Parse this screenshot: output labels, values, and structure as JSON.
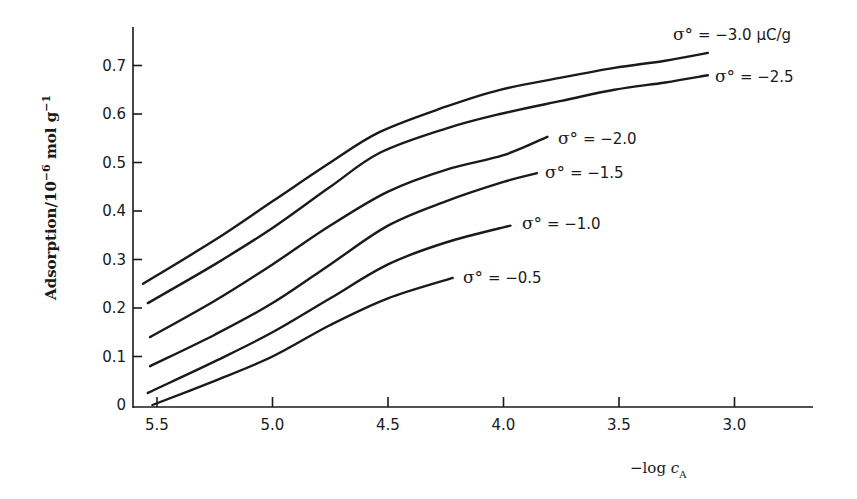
{
  "chart_data": {
    "type": "line",
    "title": "",
    "xlabel": "-log c_A",
    "xlabel_main": "−log ",
    "xlabel_var": "c",
    "xlabel_sub": "A",
    "ylabel": "Adsorption/10^-6 mol g^-1",
    "ylabel_main": "Adsorption/10",
    "ylabel_exp1": "−6",
    "ylabel_mid": " mol g",
    "ylabel_exp2": "−1",
    "xlim": [
      5.56,
      3.0
    ],
    "x_inverted": true,
    "ylim": [
      0,
      0.78
    ],
    "x_ticks": [
      5.5,
      5.0,
      4.5,
      4.0,
      3.5,
      3.0
    ],
    "x_tick_labels": [
      "5.5",
      "5.0",
      "4.5",
      "4.0",
      "3.5",
      "3.0"
    ],
    "y_ticks": [
      0,
      0.1,
      0.2,
      0.3,
      0.4,
      0.5,
      0.6,
      0.7
    ],
    "y_tick_labels": [
      "0",
      "0.1",
      "0.2",
      "0.3",
      "0.4",
      "0.5",
      "0.6",
      "0.7"
    ],
    "grid": false,
    "legend": "inline labels at curve ends",
    "series": [
      {
        "name": "σ° = −3.0 μC/g",
        "sigma": -3.0,
        "label_prefix": "σ°",
        "label_text": " = −3.0 μC/g",
        "x": [
          5.56,
          5.25,
          5.0,
          4.75,
          4.535,
          4.25,
          4.015,
          3.75,
          3.52,
          3.3,
          3.115
        ],
        "y": [
          0.25,
          0.34,
          0.42,
          0.5,
          0.563,
          0.615,
          0.65,
          0.675,
          0.695,
          0.71,
          0.726
        ]
      },
      {
        "name": "σ° = −2.5",
        "sigma": -2.5,
        "label_prefix": "σ°",
        "label_text": " = −2.5",
        "x": [
          5.54,
          5.25,
          5.0,
          4.75,
          4.535,
          4.25,
          4.015,
          3.75,
          3.52,
          3.3,
          3.115
        ],
        "y": [
          0.21,
          0.29,
          0.365,
          0.45,
          0.52,
          0.57,
          0.6,
          0.627,
          0.65,
          0.665,
          0.68
        ]
      },
      {
        "name": "σ° = −2.0",
        "sigma": -2.0,
        "label_prefix": "σ°",
        "label_text": " = −2.0",
        "x": [
          5.53,
          5.25,
          5.0,
          4.75,
          4.5,
          4.25,
          4.0,
          3.81
        ],
        "y": [
          0.14,
          0.215,
          0.29,
          0.37,
          0.44,
          0.485,
          0.515,
          0.553
        ]
      },
      {
        "name": "σ° = −1.5",
        "sigma": -1.5,
        "label_prefix": "σ°",
        "label_text": " = −1.5",
        "x": [
          5.53,
          5.25,
          5.0,
          4.75,
          4.5,
          4.25,
          4.0,
          3.855
        ],
        "y": [
          0.08,
          0.145,
          0.21,
          0.29,
          0.37,
          0.42,
          0.46,
          0.478
        ]
      },
      {
        "name": "σ° = −1.0",
        "sigma": -1.0,
        "label_prefix": "σ°",
        "label_text": " = −1.0",
        "x": [
          5.54,
          5.25,
          5.0,
          4.75,
          4.5,
          4.25,
          3.97
        ],
        "y": [
          0.025,
          0.09,
          0.15,
          0.22,
          0.29,
          0.335,
          0.37
        ]
      },
      {
        "name": "σ° = −0.5",
        "sigma": -0.5,
        "label_prefix": "σ°",
        "label_text": " = −0.5",
        "x": [
          5.52,
          5.25,
          5.0,
          4.75,
          4.5,
          4.22
        ],
        "y": [
          0.0,
          0.05,
          0.1,
          0.165,
          0.22,
          0.262
        ]
      }
    ]
  },
  "layout": {
    "label_positions": [
      {
        "x": 673,
        "y": 40
      },
      {
        "x": 715,
        "y": 82
      },
      {
        "x": 558,
        "y": 144
      },
      {
        "x": 545,
        "y": 178
      },
      {
        "x": 522,
        "y": 229
      },
      {
        "x": 463,
        "y": 283
      }
    ]
  }
}
